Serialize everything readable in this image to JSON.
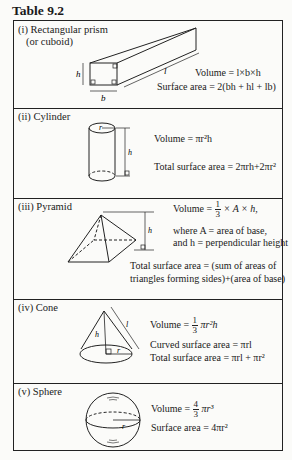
{
  "title": "Table 9.2",
  "rows": [
    {
      "label_1": "(i) Rectangular prism",
      "label_2": "(or cuboid)",
      "volume": "Volume = l×b×h",
      "surface": "Surface area = 2(bh + hl + lb)",
      "dims": {
        "h": "h",
        "b": "b",
        "l": "l"
      }
    },
    {
      "label": "(ii) Cylinder",
      "volume": "Volume = πr²h",
      "surface": "Total surface area = 2πrh+2πr²",
      "dims": {
        "r": "r",
        "h": "h"
      }
    },
    {
      "label": "(iii) Pyramid",
      "volume_prefix": "Volume =",
      "volume_frac_num": "1",
      "volume_frac_den": "3",
      "volume_suffix": "× A × h,",
      "where_1": "where A = area of base,",
      "where_2": "and h = perpendicular height",
      "surface_1": "Total surface area = (sum of areas of",
      "surface_2": "triangles forming sides)+(area of base)",
      "dims": {
        "h": "h"
      }
    },
    {
      "label": "(iv) Cone",
      "volume_prefix": "Volume =",
      "volume_frac_num": "1",
      "volume_frac_den": "3",
      "volume_suffix": "πr²h",
      "curved": "Curved surface area = πrl",
      "total": "Total surface area = πrl + πr²",
      "dims": {
        "h": "h",
        "l": "l",
        "r": "r"
      }
    },
    {
      "label": "(v) Sphere",
      "volume_prefix": "Volume =",
      "volume_frac_num": "4",
      "volume_frac_den": "3",
      "volume_suffix": "πr³",
      "surface": "Surface area = 4πr²",
      "dims": {
        "r": "r"
      }
    }
  ]
}
